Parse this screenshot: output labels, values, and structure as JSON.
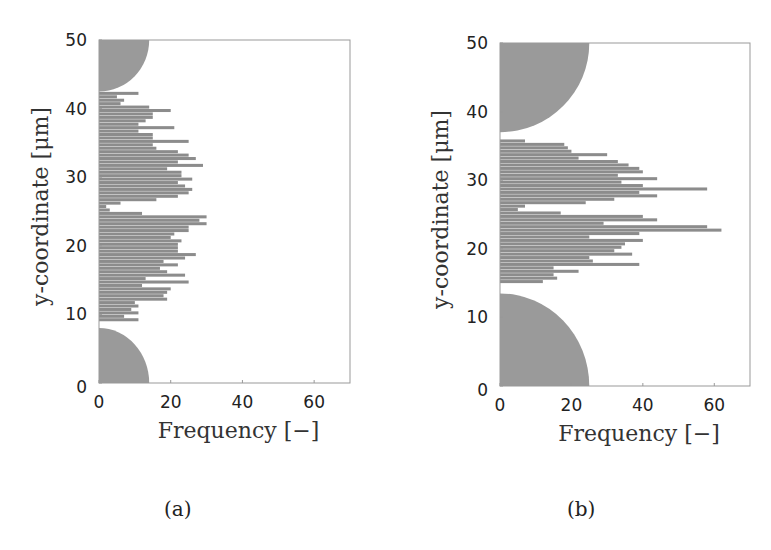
{
  "chart_data": [
    {
      "id": "a",
      "type": "bar",
      "orientation": "horizontal",
      "caption": "(a)",
      "title": "",
      "xlabel": "Frequency [−]",
      "ylabel": "y-coordinate [μm]",
      "xlim": [
        0,
        70
      ],
      "ylim": [
        0,
        50
      ],
      "xticks": [
        0,
        20,
        40,
        60
      ],
      "yticks": [
        0,
        10,
        20,
        30,
        40,
        50
      ],
      "grid": false,
      "legend": null,
      "bin_width": 0.5,
      "obstacles": [
        {
          "shape": "quarter-circle",
          "anchor": "top-left",
          "y_edge": 42.5,
          "x_extent": 14
        },
        {
          "shape": "quarter-circle",
          "anchor": "bottom-left",
          "y_edge": 8,
          "x_extent": 14
        }
      ],
      "bins": [
        {
          "y": 9.0,
          "f": 11
        },
        {
          "y": 9.5,
          "f": 7
        },
        {
          "y": 10.0,
          "f": 11
        },
        {
          "y": 10.5,
          "f": 9
        },
        {
          "y": 11.0,
          "f": 11
        },
        {
          "y": 11.5,
          "f": 10
        },
        {
          "y": 12.0,
          "f": 19
        },
        {
          "y": 12.5,
          "f": 18
        },
        {
          "y": 13.0,
          "f": 19
        },
        {
          "y": 13.5,
          "f": 20
        },
        {
          "y": 14.0,
          "f": 12
        },
        {
          "y": 14.5,
          "f": 25
        },
        {
          "y": 15.0,
          "f": 13
        },
        {
          "y": 15.5,
          "f": 24
        },
        {
          "y": 16.0,
          "f": 19
        },
        {
          "y": 16.5,
          "f": 17
        },
        {
          "y": 17.0,
          "f": 22
        },
        {
          "y": 17.5,
          "f": 18
        },
        {
          "y": 18.0,
          "f": 24
        },
        {
          "y": 18.5,
          "f": 27
        },
        {
          "y": 19.0,
          "f": 22
        },
        {
          "y": 19.5,
          "f": 22
        },
        {
          "y": 20.0,
          "f": 22
        },
        {
          "y": 20.5,
          "f": 23
        },
        {
          "y": 21.0,
          "f": 20
        },
        {
          "y": 21.5,
          "f": 21
        },
        {
          "y": 22.0,
          "f": 25
        },
        {
          "y": 22.5,
          "f": 25
        },
        {
          "y": 23.0,
          "f": 30
        },
        {
          "y": 23.5,
          "f": 28
        },
        {
          "y": 24.0,
          "f": 30
        },
        {
          "y": 24.5,
          "f": 12
        },
        {
          "y": 25.0,
          "f": 3
        },
        {
          "y": 25.5,
          "f": 2
        },
        {
          "y": 26.0,
          "f": 6
        },
        {
          "y": 26.5,
          "f": 16
        },
        {
          "y": 27.0,
          "f": 22
        },
        {
          "y": 27.5,
          "f": 25
        },
        {
          "y": 28.0,
          "f": 26
        },
        {
          "y": 28.5,
          "f": 24
        },
        {
          "y": 29.0,
          "f": 22
        },
        {
          "y": 29.5,
          "f": 26
        },
        {
          "y": 30.0,
          "f": 23
        },
        {
          "y": 30.5,
          "f": 23
        },
        {
          "y": 31.0,
          "f": 19
        },
        {
          "y": 31.5,
          "f": 29
        },
        {
          "y": 32.0,
          "f": 22
        },
        {
          "y": 32.5,
          "f": 27
        },
        {
          "y": 33.0,
          "f": 25
        },
        {
          "y": 33.5,
          "f": 22
        },
        {
          "y": 34.0,
          "f": 16
        },
        {
          "y": 34.5,
          "f": 15
        },
        {
          "y": 35.0,
          "f": 25
        },
        {
          "y": 35.5,
          "f": 15
        },
        {
          "y": 36.0,
          "f": 15
        },
        {
          "y": 36.5,
          "f": 11
        },
        {
          "y": 37.0,
          "f": 21
        },
        {
          "y": 37.5,
          "f": 11
        },
        {
          "y": 38.0,
          "f": 13
        },
        {
          "y": 38.5,
          "f": 15
        },
        {
          "y": 39.0,
          "f": 15
        },
        {
          "y": 39.5,
          "f": 20
        },
        {
          "y": 40.0,
          "f": 14
        },
        {
          "y": 40.5,
          "f": 6
        },
        {
          "y": 41.0,
          "f": 7
        },
        {
          "y": 41.5,
          "f": 5
        },
        {
          "y": 42.0,
          "f": 11
        }
      ]
    },
    {
      "id": "b",
      "type": "bar",
      "orientation": "horizontal",
      "caption": "(b)",
      "title": "",
      "xlabel": "Frequency [−]",
      "ylabel": "y-coordinate [μm]",
      "xlim": [
        0,
        70
      ],
      "ylim": [
        0,
        50
      ],
      "xticks": [
        0,
        20,
        40,
        60
      ],
      "yticks": [
        0,
        10,
        20,
        30,
        40,
        50
      ],
      "grid": false,
      "legend": null,
      "bin_width": 0.5,
      "obstacles": [
        {
          "shape": "quarter-circle",
          "anchor": "top-left",
          "y_edge": 37,
          "x_extent": 25
        },
        {
          "shape": "quarter-circle",
          "anchor": "bottom-left",
          "y_edge": 13.5,
          "x_extent": 25
        }
      ],
      "bins": [
        {
          "y": 15.0,
          "f": 12
        },
        {
          "y": 15.5,
          "f": 16
        },
        {
          "y": 16.0,
          "f": 15
        },
        {
          "y": 16.5,
          "f": 22
        },
        {
          "y": 17.0,
          "f": 15
        },
        {
          "y": 17.5,
          "f": 39
        },
        {
          "y": 18.0,
          "f": 26
        },
        {
          "y": 18.5,
          "f": 25
        },
        {
          "y": 19.0,
          "f": 37
        },
        {
          "y": 19.5,
          "f": 32
        },
        {
          "y": 20.0,
          "f": 34
        },
        {
          "y": 20.5,
          "f": 35
        },
        {
          "y": 21.0,
          "f": 40
        },
        {
          "y": 21.5,
          "f": 25
        },
        {
          "y": 22.0,
          "f": 39
        },
        {
          "y": 22.5,
          "f": 62
        },
        {
          "y": 23.0,
          "f": 58
        },
        {
          "y": 23.5,
          "f": 29
        },
        {
          "y": 24.0,
          "f": 44
        },
        {
          "y": 24.5,
          "f": 40
        },
        {
          "y": 25.0,
          "f": 17
        },
        {
          "y": 25.5,
          "f": 5
        },
        {
          "y": 26.0,
          "f": 7
        },
        {
          "y": 26.5,
          "f": 24
        },
        {
          "y": 27.0,
          "f": 32
        },
        {
          "y": 27.5,
          "f": 44
        },
        {
          "y": 28.0,
          "f": 39
        },
        {
          "y": 28.5,
          "f": 58
        },
        {
          "y": 29.0,
          "f": 40
        },
        {
          "y": 29.5,
          "f": 34
        },
        {
          "y": 30.0,
          "f": 44
        },
        {
          "y": 30.5,
          "f": 33
        },
        {
          "y": 31.0,
          "f": 40
        },
        {
          "y": 31.5,
          "f": 39
        },
        {
          "y": 32.0,
          "f": 36
        },
        {
          "y": 32.5,
          "f": 33
        },
        {
          "y": 33.0,
          "f": 22
        },
        {
          "y": 33.5,
          "f": 30
        },
        {
          "y": 34.0,
          "f": 20
        },
        {
          "y": 34.5,
          "f": 19
        },
        {
          "y": 35.0,
          "f": 18
        },
        {
          "y": 35.5,
          "f": 7
        }
      ]
    }
  ],
  "panels": [
    {
      "caption": "(a)",
      "xlabel": "Frequency",
      "xunit": "[−]",
      "ylabel": "y-coordinate",
      "yunit": "[μm]"
    },
    {
      "caption": "(b)",
      "xlabel": "Frequency",
      "xunit": "[−]",
      "ylabel": "y-coordinate",
      "yunit": "[μm]"
    }
  ],
  "style": {
    "bar_color": "#8c8c8c",
    "obstacle_color": "#9a9a9a",
    "axis_color": "#999999"
  }
}
